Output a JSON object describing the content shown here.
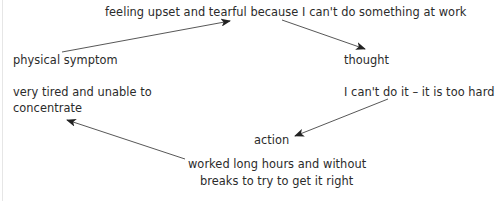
{
  "diagram": {
    "type": "cycle",
    "feeling": {
      "text": "feeling upset and tearful because I can't do something at work"
    },
    "thought": {
      "label": "thought",
      "text": "I can't do it – it is too hard"
    },
    "action": {
      "label": "action",
      "text_line1": "worked long hours and without",
      "text_line2": "breaks to try to get it right"
    },
    "physical_symptom": {
      "label": "physical symptom",
      "text_line1": "very tired and unable to",
      "text_line2": "concentrate"
    },
    "arrows": [
      {
        "from": "physical_symptom",
        "to": "feeling"
      },
      {
        "from": "feeling",
        "to": "thought"
      },
      {
        "from": "thought",
        "to": "action"
      },
      {
        "from": "action",
        "to": "physical_symptom"
      }
    ],
    "colors": {
      "text": "#2b2b2b",
      "arrow": "#333333",
      "background": "#ffffff"
    }
  }
}
